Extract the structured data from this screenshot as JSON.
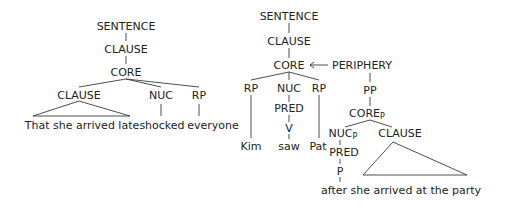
{
  "colors": {
    "text": "#222222",
    "lines": "#3a3a3a",
    "background": "#ffffff"
  },
  "left_tree": {
    "sentence": "SENTENCE",
    "clause": "CLAUSE",
    "core": "CORE",
    "subject_clause": "CLAUSE",
    "nuc": "NUC",
    "rp": "RP",
    "subject_text": "That she arrived late",
    "verb": "shocked",
    "object": "everyone"
  },
  "right_tree": {
    "sentence": "SENTENCE",
    "clause": "CLAUSE",
    "core": "CORE",
    "arrow": "←",
    "periphery": "PERIPHERY",
    "rp1": "RP",
    "nuc": "NUC",
    "rp2": "RP",
    "pred": "PRED",
    "v": "V",
    "kim": "Kim",
    "saw": "saw",
    "pat": "Pat",
    "pp": "PP",
    "core_p": "CORE",
    "core_p_sub": "P",
    "nuc_p": "NUC",
    "nuc_p_sub": "P",
    "clause_p": "CLAUSE",
    "pred_p": "PRED",
    "p": "P",
    "adjunct_text": "after she arrived at the party"
  }
}
